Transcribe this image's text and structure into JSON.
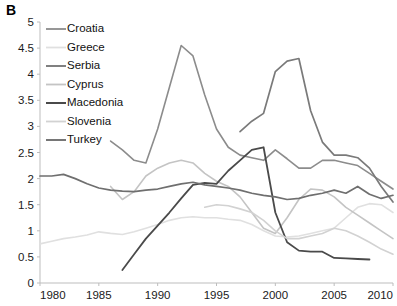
{
  "figure": {
    "panel_label": "B"
  },
  "chart_data": {
    "type": "line",
    "title": "",
    "subtitle": "",
    "xlabel": "",
    "ylabel": "",
    "xlim": [
      1980,
      2010
    ],
    "ylim": [
      0,
      5
    ],
    "xticks": [
      1980,
      1985,
      1990,
      1995,
      2000,
      2005,
      2010
    ],
    "xtick_labels": [
      "1980",
      "1985",
      "1990",
      "1995",
      "2000",
      "2005",
      "2010"
    ],
    "yticks": [
      0,
      0.5,
      1,
      1.5,
      2,
      2.5,
      3,
      3.5,
      4,
      4.5,
      5
    ],
    "ytick_labels": [
      "0",
      "0.5",
      "1",
      "1.5",
      "2",
      "2.5",
      "3",
      "3.5",
      "4",
      "4.5",
      "5"
    ],
    "grid": false,
    "legend_position": "upper-left-inside",
    "series": [
      {
        "name": "Croatia",
        "color": "#8c8c8c",
        "width": 1.6,
        "x": [
          1986,
          1987,
          1988,
          1989,
          1990,
          1991,
          1992,
          1993,
          1994,
          1995,
          1996,
          1997,
          1998,
          1999,
          2000,
          2001,
          2002,
          2003,
          2004,
          2005,
          2006,
          2007,
          2008,
          2009,
          2010
        ],
        "values": [
          2.72,
          2.55,
          2.35,
          2.3,
          2.95,
          3.75,
          4.55,
          4.35,
          3.6,
          2.95,
          2.6,
          2.45,
          2.4,
          2.35,
          2.55,
          2.38,
          2.2,
          2.2,
          2.35,
          2.35,
          2.3,
          2.25,
          2.1,
          1.95,
          1.8
        ]
      },
      {
        "name": "Greece",
        "color": "#e0e0e0",
        "width": 1.6,
        "x": [
          1980,
          1981,
          1982,
          1983,
          1984,
          1985,
          1986,
          1987,
          1988,
          1989,
          1990,
          1991,
          1992,
          1993,
          1994,
          1995,
          1996,
          1997,
          1998,
          1999,
          2000,
          2001,
          2002,
          2003,
          2004,
          2005,
          2006,
          2007,
          2008,
          2009,
          2010
        ],
        "values": [
          0.75,
          0.8,
          0.85,
          0.88,
          0.92,
          0.98,
          0.95,
          0.93,
          0.98,
          1.05,
          1.12,
          1.2,
          1.25,
          1.27,
          1.25,
          1.25,
          1.22,
          1.2,
          1.12,
          1.0,
          0.9,
          0.88,
          0.9,
          0.95,
          1.0,
          1.05,
          1.25,
          1.45,
          1.52,
          1.5,
          1.35
        ]
      },
      {
        "name": "Serbia",
        "color": "#7a7a7a",
        "width": 1.7,
        "x": [
          1997,
          1998,
          1999,
          2000,
          2001,
          2002,
          2003,
          2004,
          2005,
          2006,
          2007,
          2008,
          2009,
          2010
        ],
        "values": [
          2.9,
          3.1,
          3.25,
          4.05,
          4.25,
          4.3,
          3.3,
          2.7,
          2.45,
          2.45,
          2.4,
          2.2,
          1.85,
          1.55
        ]
      },
      {
        "name": "Cyprus",
        "color": "#c4c4c4",
        "width": 1.6,
        "x": [
          1986,
          1987,
          1988,
          1989,
          1990,
          1991,
          1992,
          1993,
          1994,
          1995,
          1996,
          1997,
          1998,
          1999,
          2000,
          2001,
          2002,
          2003,
          2004,
          2005,
          2006,
          2007,
          2008,
          2009,
          2010
        ],
        "values": [
          1.85,
          1.6,
          1.75,
          2.05,
          2.2,
          2.3,
          2.35,
          2.3,
          2.1,
          1.95,
          1.85,
          1.65,
          1.35,
          1.05,
          0.95,
          1.25,
          1.6,
          1.8,
          1.78,
          1.65,
          1.45,
          1.3,
          1.15,
          1.0,
          0.85
        ]
      },
      {
        "name": "Macedonia",
        "color": "#4a4a4a",
        "width": 1.8,
        "x": [
          1987,
          1988,
          1989,
          1990,
          1991,
          1992,
          1993,
          1994,
          1995,
          1996,
          1997,
          1998,
          1999,
          2000,
          2001,
          2002,
          2003,
          2004,
          2005,
          2006,
          2007,
          2008
        ],
        "values": [
          0.25,
          0.55,
          0.85,
          1.1,
          1.35,
          1.62,
          1.88,
          1.92,
          1.9,
          2.15,
          2.35,
          2.55,
          2.6,
          1.35,
          0.78,
          0.62,
          0.6,
          0.6,
          0.48,
          0.47,
          0.46,
          0.45
        ]
      },
      {
        "name": "Slovenia",
        "color": "#d2d2d2",
        "width": 1.6,
        "x": [
          1994,
          1995,
          1996,
          1997,
          1998,
          1999,
          2000,
          2001,
          2002,
          2003,
          2004,
          2005,
          2006,
          2007,
          2008,
          2009,
          2010
        ],
        "values": [
          1.45,
          1.5,
          1.48,
          1.42,
          1.35,
          1.2,
          1.0,
          0.85,
          0.85,
          0.9,
          0.95,
          1.05,
          1.0,
          0.9,
          0.78,
          0.65,
          0.55
        ]
      },
      {
        "name": "Turkey",
        "color": "#6f6f6f",
        "width": 1.7,
        "x": [
          1980,
          1981,
          1982,
          1983,
          1984,
          1985,
          1986,
          1987,
          1988,
          1989,
          1990,
          1991,
          1992,
          1993,
          1994,
          1995,
          1996,
          1997,
          1998,
          1999,
          2000,
          2001,
          2002,
          2003,
          2004,
          2005,
          2006,
          2007,
          2008,
          2009,
          2010
        ],
        "values": [
          2.05,
          2.05,
          2.08,
          2.0,
          1.9,
          1.82,
          1.78,
          1.76,
          1.75,
          1.78,
          1.8,
          1.85,
          1.9,
          1.93,
          1.88,
          1.85,
          1.82,
          1.78,
          1.72,
          1.68,
          1.65,
          1.6,
          1.62,
          1.68,
          1.72,
          1.78,
          1.72,
          1.85,
          1.7,
          1.62,
          1.68
        ]
      }
    ]
  },
  "legend": {
    "items": [
      {
        "label": "Croatia"
      },
      {
        "label": "Greece"
      },
      {
        "label": "Serbia"
      },
      {
        "label": "Cyprus"
      },
      {
        "label": "Macedonia"
      },
      {
        "label": "Slovenia"
      },
      {
        "label": "Turkey"
      }
    ]
  }
}
